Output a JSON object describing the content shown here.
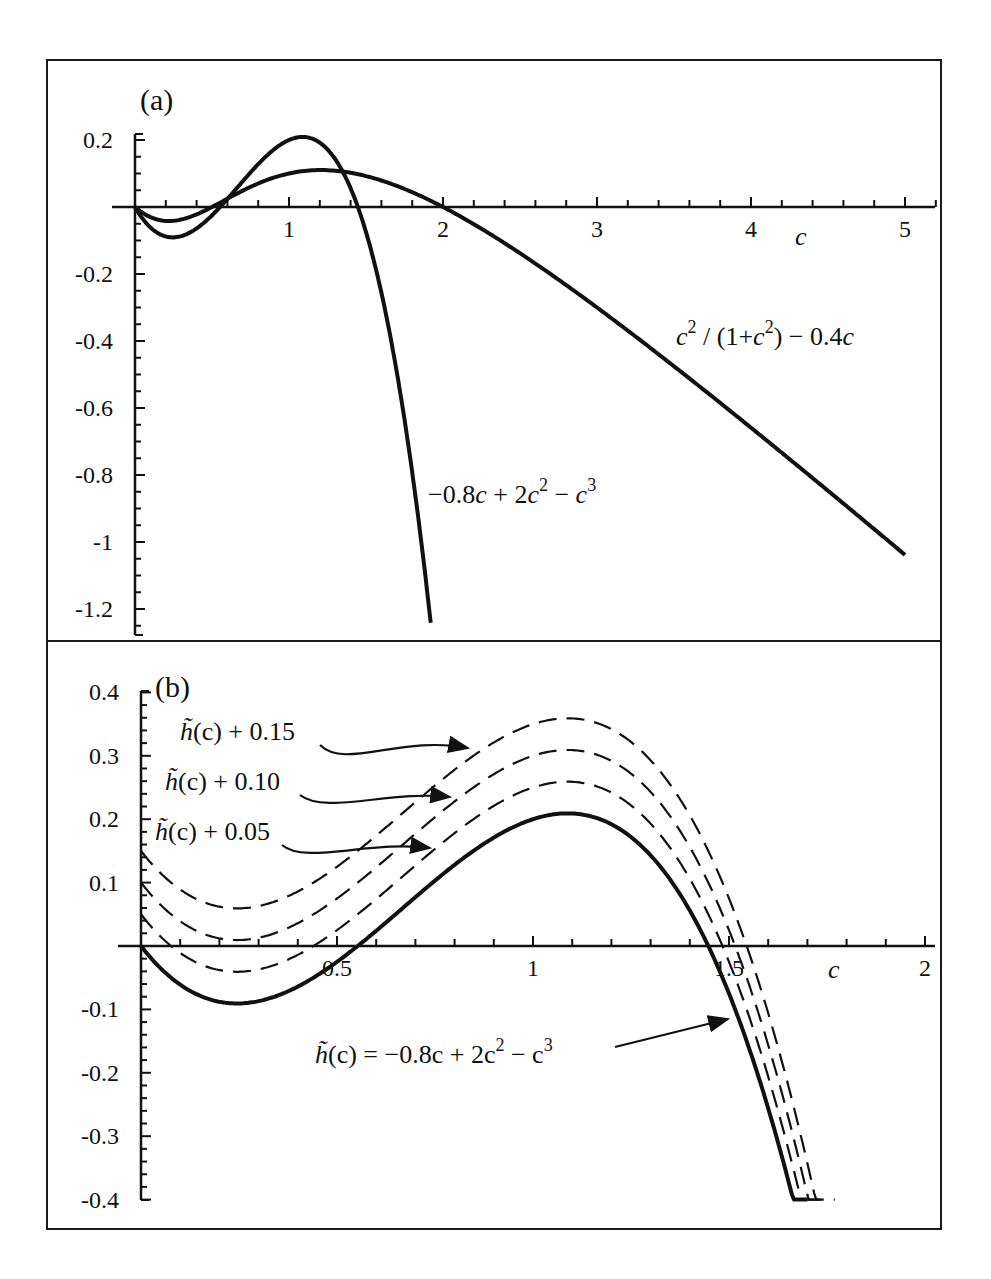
{
  "figure": {
    "frame_color": "#1a1a1a",
    "curve_color": "#111111"
  },
  "chart_data": [
    {
      "panel_label": "(a)",
      "type": "line",
      "title": "",
      "xlabel": "c",
      "ylabel": "",
      "xlim": [
        0,
        5.2
      ],
      "ylim": [
        -1.25,
        0.25
      ],
      "x_ticks": [
        1,
        2,
        3,
        4,
        5
      ],
      "x_tick_labels": [
        "1",
        "2",
        "3",
        "4",
        "5"
      ],
      "x_minor_step": 0.2,
      "y_ticks": [
        0.2,
        -0.2,
        -0.4,
        -0.6,
        -0.8,
        -1,
        -1.2
      ],
      "y_tick_labels": [
        "0.2",
        "-0.2",
        "-0.4",
        "-0.6",
        "-0.8",
        "-1",
        "-1.2"
      ],
      "y_minor_step": 0.05,
      "grid": false,
      "legend": "none (inline annotations)",
      "series": [
        {
          "name": "-0.8c + 2c^2 - c^3",
          "annotation": "−0.8c + 2c² − c³",
          "style": "solid",
          "x": [
            0,
            0.2,
            0.4,
            0.6,
            0.8,
            1.0,
            1.1,
            1.2,
            1.4,
            1.6,
            1.8,
            1.92
          ],
          "y": [
            0,
            -0.088,
            -0.064,
            0.024,
            0.128,
            0.2,
            0.209,
            0.192,
            0.056,
            -0.256,
            -0.792,
            -1.25
          ]
        },
        {
          "name": "c^2/(1+c^2) - 0.4c",
          "annotation": "c² / (1+c²) − 0.4c",
          "style": "solid",
          "x": [
            0,
            0.2,
            0.4,
            0.6,
            0.8,
            1.0,
            1.2,
            1.5,
            2.0,
            2.5,
            3.0,
            3.5,
            4.0,
            4.5,
            5.0
          ],
          "y": [
            0,
            -0.042,
            -0.022,
            0.025,
            0.068,
            0.1,
            0.11,
            0.092,
            0.0,
            -0.138,
            -0.3,
            -0.475,
            -0.659,
            -0.847,
            -1.038
          ]
        }
      ],
      "annotations": [
        {
          "text": "c² / (1+c²) − 0.4c",
          "near_series": 1
        },
        {
          "text": "−0.8c + 2c² − c³",
          "near_series": 0
        }
      ]
    },
    {
      "panel_label": "(b)",
      "type": "line",
      "title": "",
      "xlabel": "c",
      "ylabel": "",
      "xlim": [
        0,
        2.05
      ],
      "ylim": [
        -0.4,
        0.4
      ],
      "x_ticks": [
        0.5,
        1,
        1.5,
        2
      ],
      "x_tick_labels": [
        "0.5",
        "1",
        "1.5",
        "2"
      ],
      "x_minor_step": 0.1,
      "y_ticks": [
        0.4,
        0.3,
        0.2,
        0.1,
        -0.1,
        -0.2,
        -0.3,
        -0.4
      ],
      "y_tick_labels": [
        "0.4",
        "0.3",
        "0.2",
        "0.1",
        "-0.1",
        "-0.2",
        "-0.3",
        "-0.4"
      ],
      "y_minor_step": 0.02,
      "grid": false,
      "legend": "none (arrow annotations)",
      "series": [
        {
          "name": "h~(c) = -0.8c + 2c^2 - c^3",
          "annotation": "h̃(c) = −0.8c + 2c² − c³",
          "style": "solid",
          "offset": 0,
          "x": [
            0,
            0.2,
            0.4,
            0.6,
            0.8,
            1.0,
            1.1,
            1.2,
            1.4,
            1.6,
            1.7
          ],
          "y": [
            0,
            -0.088,
            -0.064,
            0.024,
            0.128,
            0.2,
            0.209,
            0.192,
            0.056,
            -0.256,
            -0.393
          ]
        },
        {
          "name": "h~(c) + 0.05",
          "annotation": "h̃(c) + 0.05",
          "style": "dashed",
          "offset": 0.05,
          "x": [
            0,
            0.2,
            0.4,
            0.6,
            0.8,
            1.0,
            1.1,
            1.2,
            1.4,
            1.6,
            1.73
          ],
          "y": [
            0.05,
            -0.038,
            -0.014,
            0.074,
            0.178,
            0.25,
            0.259,
            0.242,
            0.106,
            -0.206,
            -0.4
          ]
        },
        {
          "name": "h~(c) + 0.10",
          "annotation": "h̃(c) + 0.10",
          "style": "dashed",
          "offset": 0.1,
          "x": [
            0,
            0.2,
            0.4,
            0.6,
            0.8,
            1.0,
            1.1,
            1.2,
            1.4,
            1.6,
            1.75
          ],
          "y": [
            0.1,
            0.012,
            0.036,
            0.124,
            0.228,
            0.3,
            0.309,
            0.292,
            0.156,
            -0.156,
            -0.4
          ]
        },
        {
          "name": "h~(c) + 0.15",
          "annotation": "h̃(c) + 0.15",
          "style": "dashed",
          "offset": 0.15,
          "x": [
            0,
            0.2,
            0.4,
            0.6,
            0.8,
            1.0,
            1.1,
            1.2,
            1.4,
            1.6,
            1.77
          ],
          "y": [
            0.15,
            0.062,
            0.086,
            0.174,
            0.278,
            0.35,
            0.359,
            0.342,
            0.206,
            -0.106,
            -0.4
          ]
        }
      ],
      "annotations": [
        {
          "text": "h̃(c) + 0.15",
          "target_series": 3
        },
        {
          "text": "h̃(c) + 0.10",
          "target_series": 2
        },
        {
          "text": "h̃(c) + 0.05",
          "target_series": 1
        },
        {
          "text": "h̃(c) = −0.8c + 2c² − c³",
          "target_series": 0
        }
      ]
    }
  ],
  "labels": {
    "panel_a": "(a)",
    "panel_b": "(b)",
    "axis_c": "c",
    "ann_a_rational": {
      "c": "c",
      "sup1": "2",
      "mid": " / (1+",
      "c2": "c",
      "sup2": "2",
      "tail": ") − 0.4",
      "c3": "c"
    },
    "ann_a_cubic": {
      "lead": "−0.8",
      "c1": "c",
      "mid": " + 2",
      "c2": "c",
      "sup2": "2",
      "minus": " − ",
      "c3": "c",
      "sup3": "3"
    },
    "ann_b_015": {
      "h": "h̃",
      "rest": "(c) + 0.15"
    },
    "ann_b_010": {
      "h": "h̃",
      "rest": "(c) + 0.10"
    },
    "ann_b_005": {
      "h": "h̃",
      "rest": "(c) + 0.05"
    },
    "ann_b_main": {
      "h": "h̃",
      "rest": "(c) = −0.8c + 2c",
      "sup2": "2",
      "minus": " − c",
      "sup3": "3"
    }
  }
}
